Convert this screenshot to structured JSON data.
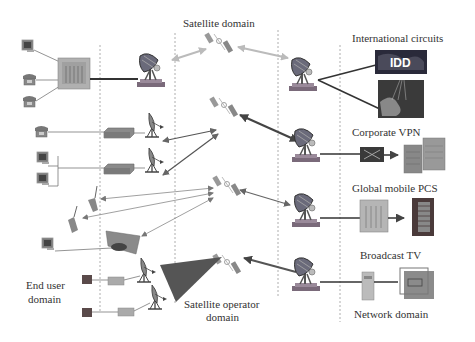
{
  "domains": {
    "satellite": "Satellite domain",
    "end_user_line1": "End user",
    "end_user_line2": "domain",
    "satellite_operator_line1": "Satellite operator",
    "satellite_operator_line2": "domain",
    "network": "Network domain"
  },
  "services": {
    "international_circuits": "International circuits",
    "idd_label": "IDD",
    "corporate_vpn": "Corporate VPN",
    "global_mobile_pcs": "Global mobile PCS",
    "broadcast_tv": "Broadcast TV"
  },
  "colors": {
    "background": "#ffffff",
    "text": "#333333",
    "dashed_line": "#999999",
    "arrow_light": "#bbbbbb",
    "arrow_dark": "#444444",
    "arrow_mid": "#666666",
    "operator_triangle": "#555555",
    "equipment": "#8a8a8a"
  }
}
